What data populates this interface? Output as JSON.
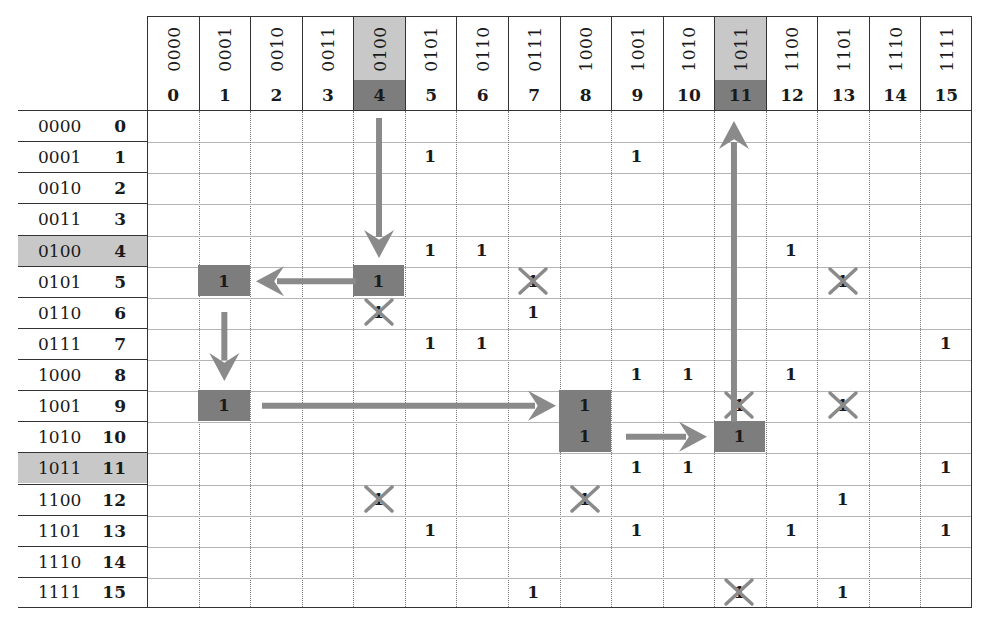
{
  "diagram": {
    "columns": [
      {
        "bin": "0000",
        "dec": "0"
      },
      {
        "bin": "0001",
        "dec": "1"
      },
      {
        "bin": "0010",
        "dec": "2"
      },
      {
        "bin": "0011",
        "dec": "3"
      },
      {
        "bin": "0100",
        "dec": "4",
        "highlight": true
      },
      {
        "bin": "0101",
        "dec": "5"
      },
      {
        "bin": "0110",
        "dec": "6"
      },
      {
        "bin": "0111",
        "dec": "7"
      },
      {
        "bin": "1000",
        "dec": "8"
      },
      {
        "bin": "1001",
        "dec": "9"
      },
      {
        "bin": "1010",
        "dec": "10"
      },
      {
        "bin": "1011",
        "dec": "11",
        "highlight": true
      },
      {
        "bin": "1100",
        "dec": "12"
      },
      {
        "bin": "1101",
        "dec": "13"
      },
      {
        "bin": "1110",
        "dec": "14"
      },
      {
        "bin": "1111",
        "dec": "15"
      }
    ],
    "rows": [
      {
        "bin": "0000",
        "dec": "0"
      },
      {
        "bin": "0001",
        "dec": "1"
      },
      {
        "bin": "0010",
        "dec": "2"
      },
      {
        "bin": "0011",
        "dec": "3"
      },
      {
        "bin": "0100",
        "dec": "4",
        "highlight": true
      },
      {
        "bin": "0101",
        "dec": "5"
      },
      {
        "bin": "0110",
        "dec": "6"
      },
      {
        "bin": "0111",
        "dec": "7"
      },
      {
        "bin": "1000",
        "dec": "8"
      },
      {
        "bin": "1001",
        "dec": "9"
      },
      {
        "bin": "1010",
        "dec": "10"
      },
      {
        "bin": "1011",
        "dec": "11",
        "highlight": true
      },
      {
        "bin": "1100",
        "dec": "12"
      },
      {
        "bin": "1101",
        "dec": "13"
      },
      {
        "bin": "1110",
        "dec": "14"
      },
      {
        "bin": "1111",
        "dec": "15"
      }
    ],
    "cells": [
      {
        "r": 1,
        "c": 5,
        "v": "1"
      },
      {
        "r": 1,
        "c": 9,
        "v": "1"
      },
      {
        "r": 4,
        "c": 5,
        "v": "1"
      },
      {
        "r": 4,
        "c": 6,
        "v": "1"
      },
      {
        "r": 4,
        "c": 12,
        "v": "1"
      },
      {
        "r": 5,
        "c": 1,
        "v": "1",
        "style": "dark"
      },
      {
        "r": 5,
        "c": 4,
        "v": "1",
        "style": "dark"
      },
      {
        "r": 5,
        "c": 7,
        "v": "1",
        "style": "crossed"
      },
      {
        "r": 5,
        "c": 13,
        "v": "1",
        "style": "crossed"
      },
      {
        "r": 6,
        "c": 4,
        "v": "1",
        "style": "crossed"
      },
      {
        "r": 6,
        "c": 7,
        "v": "1"
      },
      {
        "r": 7,
        "c": 5,
        "v": "1"
      },
      {
        "r": 7,
        "c": 6,
        "v": "1"
      },
      {
        "r": 7,
        "c": 15,
        "v": "1"
      },
      {
        "r": 8,
        "c": 9,
        "v": "1"
      },
      {
        "r": 8,
        "c": 10,
        "v": "1"
      },
      {
        "r": 8,
        "c": 12,
        "v": "1"
      },
      {
        "r": 9,
        "c": 1,
        "v": "1",
        "style": "dark"
      },
      {
        "r": 9,
        "c": 8,
        "v": "1",
        "style": "dark"
      },
      {
        "r": 9,
        "c": 11,
        "v": "1",
        "style": "crossed"
      },
      {
        "r": 9,
        "c": 13,
        "v": "1",
        "style": "crossed"
      },
      {
        "r": 10,
        "c": 8,
        "v": "1",
        "style": "dark"
      },
      {
        "r": 10,
        "c": 11,
        "v": "1",
        "style": "dark"
      },
      {
        "r": 11,
        "c": 9,
        "v": "1"
      },
      {
        "r": 11,
        "c": 10,
        "v": "1"
      },
      {
        "r": 11,
        "c": 15,
        "v": "1"
      },
      {
        "r": 12,
        "c": 4,
        "v": "1",
        "style": "crossed"
      },
      {
        "r": 12,
        "c": 8,
        "v": "1",
        "style": "crossed"
      },
      {
        "r": 12,
        "c": 13,
        "v": "1"
      },
      {
        "r": 13,
        "c": 5,
        "v": "1"
      },
      {
        "r": 13,
        "c": 9,
        "v": "1"
      },
      {
        "r": 13,
        "c": 12,
        "v": "1"
      },
      {
        "r": 13,
        "c": 15,
        "v": "1"
      },
      {
        "r": 15,
        "c": 7,
        "v": "1"
      },
      {
        "r": 15,
        "c": 11,
        "v": "1",
        "style": "crossed"
      },
      {
        "r": 15,
        "c": 13,
        "v": "1"
      }
    ],
    "arrows": [
      {
        "from": {
          "r": 0,
          "c": 4
        },
        "to": {
          "r": 5,
          "c": 4
        },
        "direction": "down"
      },
      {
        "from": {
          "r": 5,
          "c": 4
        },
        "to": {
          "r": 5,
          "c": 1
        },
        "direction": "left"
      },
      {
        "from": {
          "r": 5,
          "c": 1
        },
        "to": {
          "r": 9,
          "c": 1
        },
        "direction": "down"
      },
      {
        "from": {
          "r": 9,
          "c": 1
        },
        "to": {
          "r": 9,
          "c": 8
        },
        "direction": "right"
      },
      {
        "from": {
          "r": 10,
          "c": 8
        },
        "to": {
          "r": 10,
          "c": 11
        },
        "direction": "right"
      },
      {
        "from": {
          "r": 9,
          "c": 11
        },
        "to": {
          "r": 0,
          "c": 11
        },
        "direction": "up"
      }
    ],
    "colors": {
      "header_highlight": "#c8c8c8",
      "dark_cell": "#7d7d7d",
      "arrow": "#8a8a8a",
      "cross": "#8a8a8a",
      "grid_line": "#b5b5b5",
      "border": "#333333"
    }
  }
}
